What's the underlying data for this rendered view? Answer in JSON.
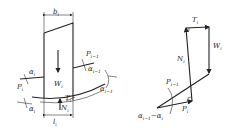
{
  "left_figure": {
    "title": "slice i",
    "labels": {
      "width_top": "b",
      "width_top_sub": "i",
      "width_bottom": "l",
      "width_bottom_sub": "i",
      "weight": "W",
      "weight_sub": "i",
      "shear": "T",
      "shear_sub": "i",
      "normal": "N",
      "normal_sub": "i",
      "force_left": "P",
      "force_left_sub": "i",
      "angle_left": "α",
      "angle_left_sub": "i",
      "angle_left2": "α",
      "angle_left2_sub": "i",
      "force_right": "P",
      "force_right_sub": "i−1",
      "angle_right": "α",
      "angle_right_sub": "i−1",
      "angle_base": "α",
      "angle_base_sub": "i−1"
    }
  },
  "right_figure": {
    "title": "force polygon",
    "labels": {
      "shear": "T",
      "shear_sub": "i",
      "weight": "W",
      "weight_sub": "i",
      "normal": "N",
      "normal_sub": "i",
      "force_prev": "P",
      "force_prev_sub": "i−1",
      "force": "P",
      "force_sub": "i",
      "angle": "α",
      "angle_sub": "i−1",
      "angle_minus": "−α",
      "angle_minus_sub": "i"
    }
  }
}
